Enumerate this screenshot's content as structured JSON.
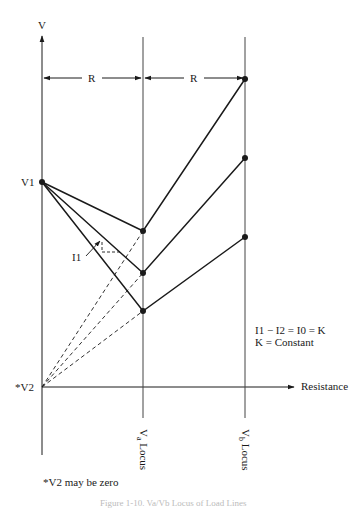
{
  "diagram": {
    "axis_y_label": "V",
    "axis_x_label": "Resistance",
    "spacing_label_1": "R",
    "spacing_label_2": "R",
    "v1_label": "V1",
    "v2_label": "*V2",
    "current_label": "I1",
    "va_locus_label": "Va Locus",
    "va_main": "V",
    "va_sub": "a",
    "vb_main": "V",
    "vb_sub": "b",
    "locus_word": "Locus",
    "equation_line1": "I1 − I2 = I0 = K",
    "equation_line2": "K = Constant",
    "footnote": "*V2 may be zero",
    "caption": "Figure 1-10. Va/Vb Locus of Load Lines"
  },
  "colors": {
    "ink": "#1a1a1a",
    "background": "#ffffff"
  }
}
